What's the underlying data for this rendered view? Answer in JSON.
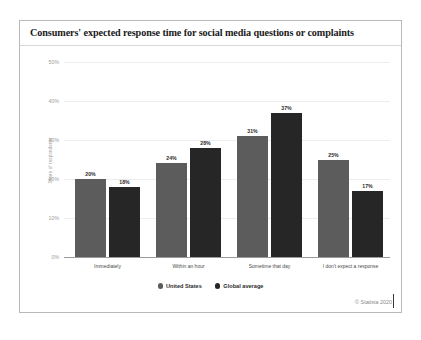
{
  "card": {
    "title": "Consumers' expected response time for social media questions or complaints",
    "copyright": "© Statista 2020"
  },
  "legend": {
    "position": "bottom-center",
    "items": [
      {
        "label": "United States",
        "color": "#5c5c5c",
        "marker": "circle-dot-icon"
      },
      {
        "label": "Global average",
        "color": "#262626",
        "marker": "circle-dot-icon"
      }
    ]
  },
  "axes": {
    "ylabel": "Share of respondents",
    "yticks": [
      "0%",
      "10%",
      "20%",
      "30%",
      "40%",
      "50%"
    ]
  },
  "chart_data": {
    "type": "bar",
    "title": "Consumers' expected response time for social media questions or complaints",
    "xlabel": "",
    "ylabel": "Share of respondents",
    "ylim": [
      0,
      50
    ],
    "ytick_values": [
      0,
      10,
      20,
      30,
      40,
      50
    ],
    "ytick_labels": [
      "0%",
      "10%",
      "20%",
      "30%",
      "40%",
      "50%"
    ],
    "grid": true,
    "grid_axis": "y",
    "legend_position": "bottom-center",
    "categories": [
      "Immediately",
      "Within an hour",
      "Sometime that day",
      "I don't expect a response"
    ],
    "series": [
      {
        "name": "United States",
        "color": "#5c5c5c",
        "values": [
          20,
          24,
          31,
          25
        ],
        "labels": [
          "20%",
          "24%",
          "31%",
          "25%"
        ]
      },
      {
        "name": "Global average",
        "color": "#262626",
        "values": [
          18,
          28,
          37,
          17
        ],
        "labels": [
          "18%",
          "28%",
          "37%",
          "17%"
        ]
      }
    ]
  }
}
